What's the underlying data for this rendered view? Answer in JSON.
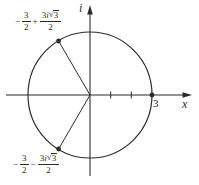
{
  "colors": {
    "ink": "#2b2b2b",
    "background": "#ffffff"
  },
  "figure": {
    "x_axis_label": "x",
    "imaginary_axis_label": "i",
    "x_intercept_label": "3",
    "radical_sign": "√",
    "upper_root": {
      "sign": "−",
      "frac1_num": "3",
      "frac1_den": "2",
      "operator": "+",
      "frac2_coeff": "3",
      "frac2_unit": "i",
      "frac2_radicand": "3",
      "frac2_den": "2"
    },
    "lower_root": {
      "sign": "−",
      "frac1_num": "3",
      "frac1_den": "2",
      "operator": "−",
      "frac2_coeff": "3",
      "frac2_unit": "i",
      "frac2_radicand": "3",
      "frac2_den": "2"
    }
  }
}
